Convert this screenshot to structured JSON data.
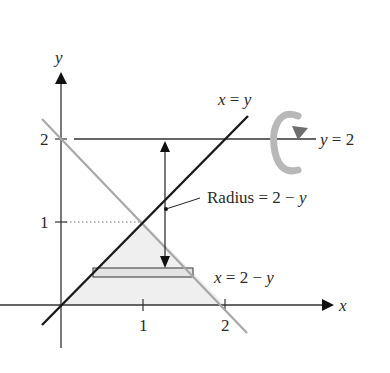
{
  "figure": {
    "axes": {
      "x_label": "x",
      "y_label": "y",
      "x_ticks": [
        "1",
        "2"
      ],
      "y_ticks": [
        "1",
        "2"
      ]
    },
    "curves": [
      {
        "name": "line-x-equals-y",
        "label": "x = y",
        "color": "#1a1a1a"
      },
      {
        "name": "line-x-equals-2-minus-y",
        "label": "x = 2 − y",
        "color": "#a8a8a8"
      },
      {
        "name": "line-y-equals-2",
        "label": "y = 2",
        "color": "#1a1a1a"
      }
    ],
    "annotations": {
      "radius": "Radius = 2 − y",
      "axis_of_rotation": "y = 2"
    },
    "labels": {
      "x_eq_y": {
        "lhs": "x",
        "eq": " = ",
        "rhs": "y"
      },
      "y_eq_2": {
        "lhs": "y",
        "eq": " = 2"
      },
      "radius": {
        "word": "Radius = 2 − ",
        "var": "y"
      },
      "x_eq_2_minus_y": {
        "lhs": "x",
        "eq": " = 2 − ",
        "var": "y"
      }
    },
    "colors": {
      "region_fill": "#efefef",
      "rotation_arrow": "#b0b0b0",
      "rotation_arrow_head": "#6e6e6e"
    }
  }
}
